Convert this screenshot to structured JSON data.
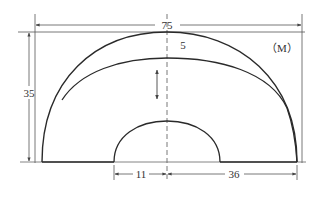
{
  "diagram": {
    "unit_label": "（M）",
    "dimensions": {
      "overall_width": "75",
      "overall_height": "35",
      "inner_radius": "11",
      "outer_span_right": "36",
      "band_thickness": "5"
    },
    "colors": {
      "stroke": "#2a2a2a",
      "dim_line": "#555555",
      "background": "#ffffff"
    }
  }
}
